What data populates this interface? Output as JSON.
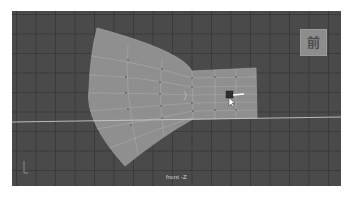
{
  "viewport": {
    "camera_label": "front -Z",
    "view_cube_label": "前",
    "background_color": "#4a4a4a",
    "grid_color": "#3a3a3a",
    "mesh_color": "#8f8f8f",
    "mesh_edge_color": "#a8a8a8",
    "ground_line_color": "#c8c8c8"
  },
  "mesh": {
    "name": "fan-bowtie-plane",
    "selected": true
  },
  "icons": {
    "view_cube": "view-cube-icon",
    "manipulator": "move-manipulator-icon",
    "axis": "axis-indicator-icon"
  }
}
